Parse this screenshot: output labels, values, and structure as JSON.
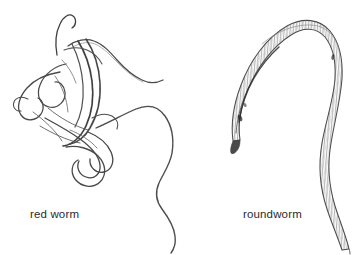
{
  "figure": {
    "kind": "scientific-line-drawing",
    "background_color": "#ffffff",
    "ink_color": "#3a3a3a",
    "ink_color_light": "#8a8a8a",
    "specimens": [
      {
        "id": "red-worm",
        "label": "red worm",
        "description": "tangled coiled threadlike worm with many overlapping loops and a long free tail trailing down to the right",
        "position": "left"
      },
      {
        "id": "roundworm",
        "label": "roundworm",
        "description": "single smooth arc-shaped nematode with tapered head at lower left, broad curved body with fine transverse annulations, and tapering tail at lower right",
        "position": "right"
      }
    ]
  },
  "captions": {
    "left": "red worm",
    "right": "roundworm"
  }
}
